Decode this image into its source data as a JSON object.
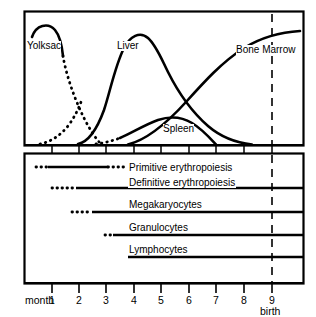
{
  "figure": {
    "type": "diagram"
  },
  "upper_panel": {
    "curve_labels": [
      {
        "name": "yolksac",
        "text": "Yolksac",
        "x": 27,
        "y": 41
      },
      {
        "name": "liver",
        "text": "Liver",
        "x": 117,
        "y": 41
      },
      {
        "name": "bone-marrow",
        "text": "Bone Marrow",
        "x": 236,
        "y": 45
      },
      {
        "name": "spleen",
        "text": "Spleen",
        "x": 163,
        "y": 125
      }
    ],
    "birth_line": {
      "label": "birth",
      "month": 9
    }
  },
  "lower_panel": {
    "bars": [
      {
        "name": "primitive-erythropoiesis",
        "label": "Primitive erythropoiesis",
        "dot_start": 36,
        "solid_start": 48,
        "solid_end": 108,
        "dot_end": 124,
        "to_edge": false,
        "y": 167,
        "label_x": 128,
        "label_y": 163
      },
      {
        "name": "definitive-erythropoiesis",
        "label": "Definitive erythropoiesis",
        "dot_start": 52,
        "solid_start": 76,
        "solid_end": 303,
        "dot_end": 76,
        "to_edge": true,
        "y": 188,
        "label_x": 128,
        "label_y": 178
      },
      {
        "name": "megakaryocytes",
        "label": "Megakaryocytes",
        "dot_start": 72,
        "solid_start": 92,
        "solid_end": 303,
        "dot_end": 92,
        "to_edge": true,
        "y": 212,
        "label_x": 128,
        "label_y": 200
      },
      {
        "name": "granulocytes",
        "label": "Granulocytes",
        "dot_start": 105,
        "solid_start": 113,
        "solid_end": 303,
        "dot_end": 113,
        "to_edge": true,
        "y": 235,
        "label_x": 128,
        "label_y": 223
      },
      {
        "name": "lymphocytes",
        "label": "Lymphocytes",
        "dot_start": 128,
        "solid_start": 128,
        "solid_end": 303,
        "dot_end": 128,
        "to_edge": true,
        "y": 257,
        "label_x": 128,
        "label_y": 245
      }
    ]
  },
  "x_axis": {
    "title": "month",
    "ticks": [
      "1",
      "2",
      "3",
      "4",
      "5",
      "6",
      "7",
      "8",
      "9"
    ],
    "birth_label": "birth"
  },
  "chart_data": {
    "type": "line",
    "title": "",
    "xlabel": "month",
    "ylabel": "",
    "xlim": [
      0,
      10
    ],
    "ylim": [
      0,
      100
    ],
    "grid": false,
    "legend": "inline-annotations",
    "series": [
      {
        "name": "Yolksac",
        "style": "solid-then-dotted",
        "x": [
          0.3,
          0.6,
          1.0,
          1.4,
          1.8,
          2.2,
          2.6,
          3.0,
          3.4
        ],
        "values": [
          62,
          82,
          85,
          80,
          60,
          38,
          20,
          8,
          0
        ]
      },
      {
        "name": "Liver",
        "style": "solid",
        "x": [
          1.0,
          1.6,
          2.2,
          2.8,
          3.4,
          4.0,
          4.6,
          5.2,
          5.8,
          6.6,
          7.4,
          8.2,
          9.0,
          9.6
        ],
        "values": [
          0,
          4,
          14,
          42,
          72,
          86,
          84,
          74,
          62,
          46,
          30,
          16,
          6,
          2
        ]
      },
      {
        "name": "Spleen",
        "style": "dotted-then-solid",
        "x": [
          2.4,
          2.9,
          3.4,
          3.9,
          4.4,
          4.9,
          5.4,
          5.9,
          6.3,
          6.7
        ],
        "values": [
          0,
          3,
          8,
          16,
          24,
          28,
          27,
          22,
          12,
          0
        ]
      },
      {
        "name": "Bone Marrow",
        "style": "solid",
        "x": [
          3.4,
          4.0,
          4.6,
          5.2,
          5.8,
          6.4,
          7.2,
          8.0,
          9.0,
          9.8
        ],
        "values": [
          0,
          16,
          34,
          50,
          63,
          73,
          83,
          89,
          93,
          94
        ]
      }
    ],
    "annotations": [
      {
        "text": "birth",
        "x": 9,
        "type": "vertical-dashed-line"
      }
    ]
  }
}
